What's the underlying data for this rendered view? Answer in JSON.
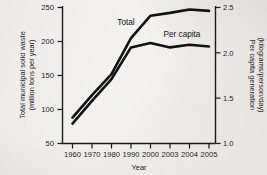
{
  "chart_data": {
    "type": "line",
    "title": "",
    "xlabel": "Year",
    "ylabel": "Total municipal solid waste (million tons per year)",
    "ylabel_line1": "Total municipal solid waste",
    "ylabel_line2": "(million tons per year)",
    "y2label": "Per capita generation (kilograms/person/day)",
    "y2label_line1": "Per capita generation",
    "y2label_line2": "(kilograms/person/day)",
    "categories": [
      "1960",
      "1970",
      "1980",
      "1990",
      "2000",
      "2003",
      "2004",
      "2005"
    ],
    "ylim": [
      50,
      250
    ],
    "yticks": [
      "50",
      "100",
      "150",
      "200",
      "250"
    ],
    "y2lim": [
      1.0,
      2.5
    ],
    "y2ticks": [
      "1.0",
      "1.5",
      "2.0",
      "2.5"
    ],
    "grid": false,
    "legend_position": "inline-annotations",
    "series": [
      {
        "name": "Total",
        "axis": "left",
        "units": "million tons per year",
        "values": [
          88,
          121,
          152,
          205,
          238,
          242,
          247,
          245
        ]
      },
      {
        "name": "Per capita",
        "axis": "right",
        "units": "kilograms/person/day",
        "values": [
          1.22,
          1.47,
          1.71,
          2.06,
          2.11,
          2.06,
          2.09,
          2.07
        ],
        "values_left_axis_equivalent": [
          78,
          111,
          143,
          190,
          197,
          190,
          194,
          192
        ]
      }
    ],
    "annotations": [
      {
        "text": "Total",
        "series": "Total"
      },
      {
        "text": "Per capita",
        "series": "Per capita"
      }
    ]
  },
  "page": {
    "bottom_partial_text": ""
  }
}
